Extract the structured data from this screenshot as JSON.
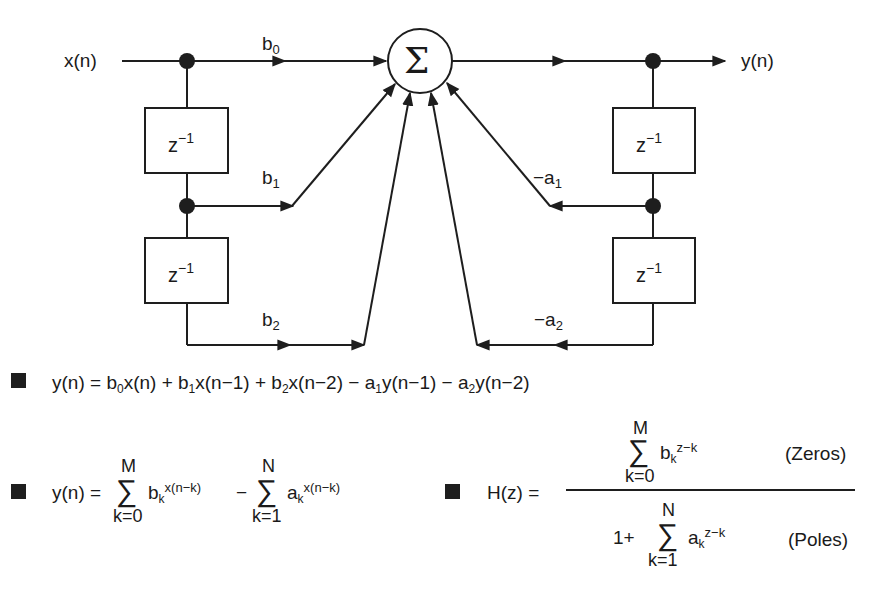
{
  "diagram": {
    "input_label": "x(n)",
    "output_label": "y(n)",
    "summer_symbol": "Σ",
    "delay_label_base": "z",
    "delay_label_exp": "−1",
    "coefficients": {
      "b0": {
        "base": "b",
        "sub": "0"
      },
      "b1": {
        "base": "b",
        "sub": "1"
      },
      "b2": {
        "base": "b",
        "sub": "2"
      },
      "a1": {
        "base": "−a",
        "sub": "1"
      },
      "a2": {
        "base": "−a",
        "sub": "2"
      }
    },
    "line_color": "#1e1e1e"
  },
  "equations": {
    "difference": {
      "lhs": "y(n) = ",
      "t1b": "b",
      "t1s": "0",
      "t1r": "x(n) + ",
      "t2b": "b",
      "t2s": "1",
      "t2r": "x(n−1) + ",
      "t3b": "b",
      "t3s": "2",
      "t3r": "x(n−2) − ",
      "t4b": "a",
      "t4s": "1",
      "t4r": "y(n−1) − ",
      "t5b": "a",
      "t5s": "2",
      "t5r": "y(n−2)"
    },
    "summation": {
      "lhs": "y(n) = ",
      "sigma": "∑",
      "upper1": "M",
      "lower1": "k=0",
      "term1_base": "b",
      "term1_sub": "k",
      "term1_sup": "x(n−k)",
      "minus": "−",
      "upper2": "N",
      "lower2": "k=1",
      "term2_base": "a",
      "term2_sub": "k",
      "term2_sup": "x(n−k)"
    },
    "transfer": {
      "lhs": "H(z) = ",
      "sigma": "∑",
      "num_upper": "M",
      "num_lower": "k=0",
      "num_base": "b",
      "num_sub": "k",
      "num_sup": "z−k",
      "num_note": "(Zeros)",
      "den_prefix": "1+",
      "den_upper": "N",
      "den_lower": "k=1",
      "den_base": "a",
      "den_sub": "k",
      "den_sup": "z−k",
      "den_note": "(Poles)"
    }
  }
}
